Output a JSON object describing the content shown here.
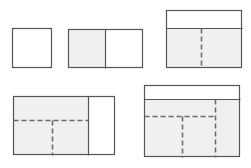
{
  "canvas": {
    "width": 251,
    "height": 168,
    "background": "#ffffff"
  },
  "style": {
    "stroke_color": "#6b6b6b",
    "stroke_color_dark": "#555555",
    "fill_gray": "#f0f0f0",
    "fill_white": "#ffffff",
    "dash_color": "#6b6b6b",
    "stroke_width": 1.2,
    "dash_pattern": "5,3"
  },
  "figures": [
    {
      "id": "figure-1",
      "name": "plain-square",
      "label": "Square outline, unfilled",
      "x": 12,
      "y": 28,
      "width": 40,
      "height": 40,
      "fill": "#ffffff",
      "solid_lines": [],
      "dashed_lines": []
    },
    {
      "id": "figure-2",
      "name": "rectangle-two-cells",
      "label": "Rectangle divided by one solid vertical line; left cell shaded",
      "x": 68,
      "y": 29,
      "width": 75,
      "height": 39,
      "fill": "#ffffff",
      "shaded_regions": [
        {
          "x": 68,
          "y": 29,
          "width": 37,
          "height": 39,
          "fill": "#f0f0f0"
        }
      ],
      "solid_lines": [
        {
          "x1": 105,
          "y1": 29,
          "x2": 105,
          "y2": 68
        }
      ],
      "dashed_lines": []
    },
    {
      "id": "figure-3",
      "name": "rectangle-band-with-dashed-split",
      "label": "Rectangle with white top band and shaded body split by a dashed vertical line",
      "x": 166,
      "y": 10,
      "width": 76,
      "height": 58,
      "fill": "#ffffff",
      "shaded_regions": [
        {
          "x": 166,
          "y": 28,
          "width": 76,
          "height": 40,
          "fill": "#f0f0f0"
        }
      ],
      "solid_lines": [
        {
          "x1": 166,
          "y1": 28,
          "x2": 242,
          "y2": 28
        }
      ],
      "dashed_lines": [
        {
          "x1": 201,
          "y1": 28,
          "x2": 201,
          "y2": 68
        }
      ]
    },
    {
      "id": "figure-4",
      "name": "rectangle-shaded-left-with-tee-dashed",
      "label": "Rectangle with shaded left portion containing dashed tee split and a white right panel",
      "x": 13,
      "y": 96,
      "width": 102,
      "height": 59,
      "fill": "#ffffff",
      "shaded_regions": [
        {
          "x": 13,
          "y": 96,
          "width": 75,
          "height": 59,
          "fill": "#f0f0f0"
        }
      ],
      "solid_lines": [
        {
          "x1": 88,
          "y1": 96,
          "x2": 88,
          "y2": 155
        }
      ],
      "dashed_lines": [
        {
          "x1": 13,
          "y1": 120,
          "x2": 88,
          "y2": 120
        },
        {
          "x1": 52,
          "y1": 120,
          "x2": 52,
          "y2": 155
        }
      ]
    },
    {
      "id": "figure-5",
      "name": "rectangle-band-with-three-dashed-splits",
      "label": "Rectangle with white top band and shaded body split by one dashed horizontal and two dashed vertical lines",
      "x": 144,
      "y": 85,
      "width": 96,
      "height": 72,
      "fill": "#ffffff",
      "shaded_regions": [
        {
          "x": 144,
          "y": 99,
          "width": 96,
          "height": 58,
          "fill": "#f0f0f0"
        }
      ],
      "solid_lines": [
        {
          "x1": 144,
          "y1": 99,
          "x2": 240,
          "y2": 99
        }
      ],
      "dashed_lines": [
        {
          "x1": 144,
          "y1": 116,
          "x2": 215,
          "y2": 116
        },
        {
          "x1": 182,
          "y1": 116,
          "x2": 182,
          "y2": 157
        },
        {
          "x1": 215,
          "y1": 99,
          "x2": 215,
          "y2": 157
        }
      ]
    }
  ]
}
